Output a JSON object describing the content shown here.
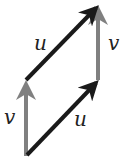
{
  "diagram": {
    "labels": {
      "u_top": "u",
      "u_bottom": "u",
      "v_left": "v",
      "v_right": "v"
    },
    "colors": {
      "u_vector": "#1a1a1a",
      "v_vector": "#808080",
      "label": "#222222"
    }
  }
}
